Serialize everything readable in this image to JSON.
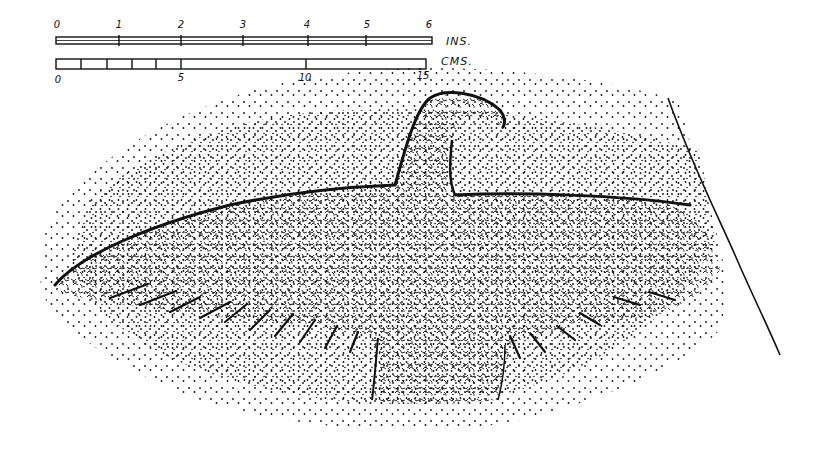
{
  "figure": {
    "colors": {
      "ink": "#111111",
      "background": "#ffffff"
    }
  },
  "scale_inches": {
    "unit_label": "INS.",
    "ticks": [
      "0",
      "1",
      "2",
      "3",
      "4",
      "5",
      "6"
    ]
  },
  "scale_cms": {
    "unit_label": "CMS.",
    "ticks": [
      "0",
      "5",
      "10",
      "15"
    ],
    "minor_divisions_first_5": 5
  }
}
